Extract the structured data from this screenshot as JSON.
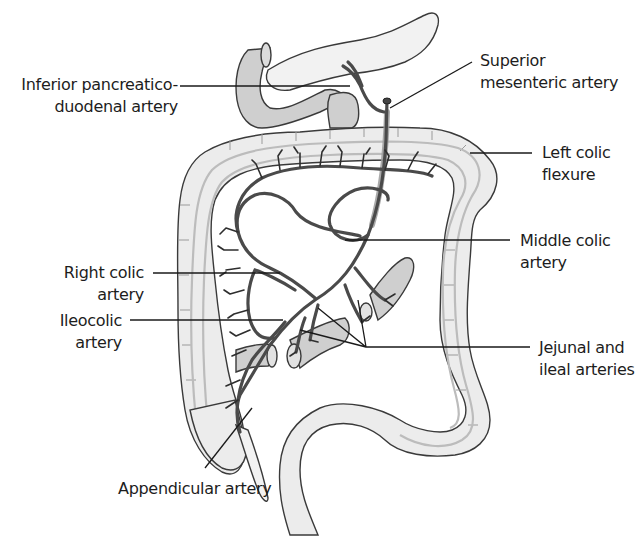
{
  "figure": {
    "labels": {
      "inferior_pancreaticoduodenal": [
        "Inferior pancreatico-",
        "duodenal artery"
      ],
      "superior_mesenteric": [
        "Superior",
        "mesenteric artery"
      ],
      "left_colic_flexure": [
        "Left colic",
        "flexure"
      ],
      "middle_colic": [
        "Middle colic",
        "artery"
      ],
      "right_colic": [
        "Right colic",
        "artery"
      ],
      "ileocolic": [
        "Ileocolic",
        "artery"
      ],
      "jejunal_ileal": [
        "Jejunal and",
        "ileal arteries"
      ],
      "appendicular": [
        "Appendicular artery"
      ]
    },
    "colors": {
      "background": "#ffffff",
      "outline": "#3a3a3a",
      "organ_fill": "#ececec",
      "duodenum_fill": "#cfcfcf",
      "artery": "#4a4a4a",
      "text": "#1d1d1d"
    }
  }
}
